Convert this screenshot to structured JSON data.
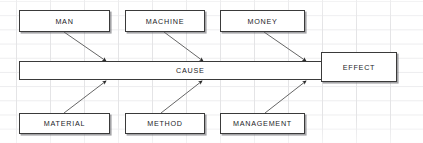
{
  "diagram": {
    "type": "fishbone-cause-and-effect",
    "spine": {
      "label": "CAUSE",
      "x": 19,
      "y": 61,
      "w": 303,
      "h": 19
    },
    "effect": {
      "label": "EFFECT",
      "x": 321,
      "y": 52,
      "w": 76,
      "h": 30
    },
    "causes_top": [
      {
        "label": "MAN",
        "x": 19,
        "y": 10,
        "w": 91,
        "h": 22,
        "arrow_from_x": 64,
        "arrow_from_y": 32,
        "arrow_to_x": 106,
        "arrow_to_y": 61
      },
      {
        "label": "MACHINE",
        "x": 125,
        "y": 10,
        "w": 80,
        "h": 22,
        "arrow_from_x": 164,
        "arrow_from_y": 32,
        "arrow_to_x": 203,
        "arrow_to_y": 61
      },
      {
        "label": "MONEY",
        "x": 220,
        "y": 10,
        "w": 85,
        "h": 22,
        "arrow_from_x": 264,
        "arrow_from_y": 32,
        "arrow_to_x": 306,
        "arrow_to_y": 61
      }
    ],
    "causes_bottom": [
      {
        "label": "MATERIAL",
        "x": 19,
        "y": 113,
        "w": 91,
        "h": 21,
        "arrow_from_x": 64,
        "arrow_from_y": 113,
        "arrow_to_x": 106,
        "arrow_to_y": 81
      },
      {
        "label": "METHOD",
        "x": 125,
        "y": 113,
        "w": 80,
        "h": 21,
        "arrow_from_x": 161,
        "arrow_from_y": 113,
        "arrow_to_x": 202,
        "arrow_to_y": 81
      },
      {
        "label": "MANAGEMENT",
        "x": 220,
        "y": 113,
        "w": 85,
        "h": 21,
        "arrow_from_x": 265,
        "arrow_from_y": 113,
        "arrow_to_x": 306,
        "arrow_to_y": 81
      }
    ],
    "colors": {
      "box_border": "#3a3a3a",
      "box_fill": "#ffffff",
      "arrow": "#555555",
      "grid_line": "#e4e4e6",
      "text": "#1d1d1f"
    }
  }
}
